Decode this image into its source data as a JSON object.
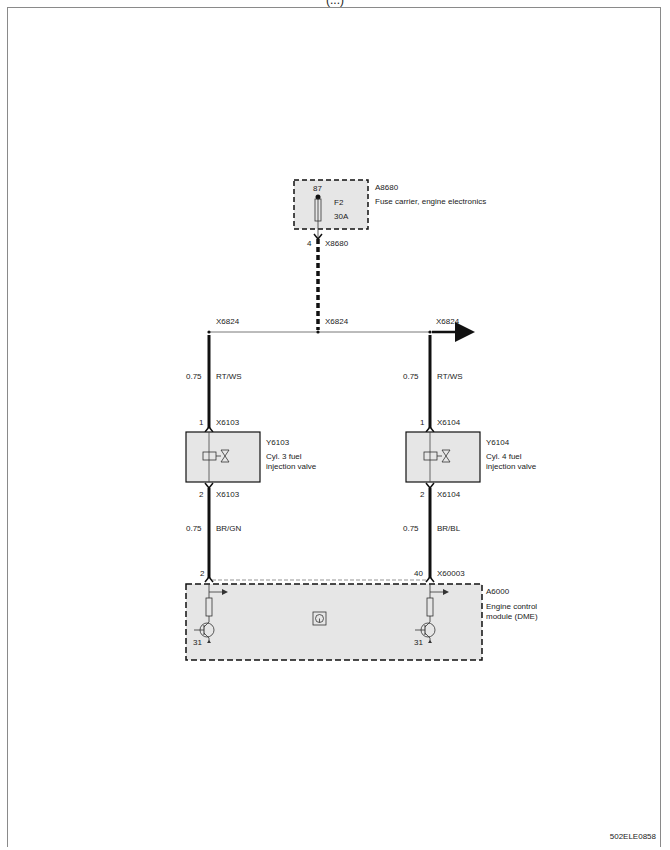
{
  "page": {
    "title_cut": "(...)",
    "doc_id": "502ELE0858"
  },
  "fuse_carrier": {
    "id": "A8680",
    "name": "Fuse carrier, engine electronics",
    "terminal": "87",
    "fuse": "F2",
    "rating": "30A",
    "pin": "4",
    "connector": "X8680"
  },
  "bus": {
    "left_label": "X6824",
    "center_label": "X6824",
    "right_label": "X6824"
  },
  "left_branch": {
    "upper_wire": {
      "gauge": "0.75",
      "color": "RT/WS"
    },
    "upper_pin": "1",
    "upper_connector": "X6103",
    "component_id": "Y6103",
    "component_name_line1": "Cyl. 3 fuel",
    "component_name_line2": "injection valve",
    "lower_pin": "2",
    "lower_connector": "X6103",
    "lower_wire": {
      "gauge": "0.75",
      "color": "BR/GN"
    },
    "ecu_pin": "2",
    "ground": "31"
  },
  "right_branch": {
    "upper_wire": {
      "gauge": "0.75",
      "color": "RT/WS"
    },
    "upper_pin": "1",
    "upper_connector": "X6104",
    "component_id": "Y6104",
    "component_name_line1": "Cyl. 4 fuel",
    "component_name_line2": "injection valve",
    "lower_pin": "2",
    "lower_connector": "X6104",
    "lower_wire": {
      "gauge": "0.75",
      "color": "BR/BL"
    },
    "ecu_pin": "40",
    "ecu_connector": "X60003",
    "ground": "31"
  },
  "ecu": {
    "id": "A6000",
    "name_line1": "Engine control",
    "name_line2": "module (DME)"
  },
  "colors": {
    "component_fill": "#e6e6e6",
    "line": "#111111",
    "frame": "#8a8a8a"
  }
}
